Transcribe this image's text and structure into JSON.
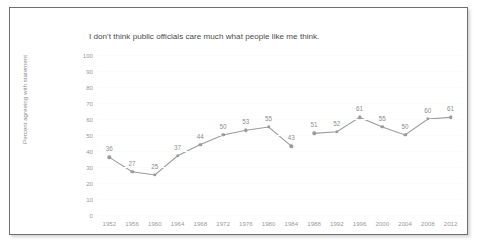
{
  "chart_data": {
    "type": "line",
    "title": "I don't think public officials care much what people like me think.",
    "xlabel": "",
    "ylabel": "Percent agreeing with statement",
    "categories": [
      "1952",
      "1956",
      "1960",
      "1964",
      "1968",
      "1972",
      "1976",
      "1980",
      "1984",
      "1988",
      "1992",
      "1996",
      "2000",
      "2004",
      "2008",
      "2012"
    ],
    "values": [
      36,
      27,
      25,
      37,
      44,
      50,
      53,
      55,
      43,
      51,
      52,
      61,
      55,
      50,
      60,
      61
    ],
    "segments": [
      {
        "categories": [
          "1952",
          "1956",
          "1960",
          "1964",
          "1968",
          "1972",
          "1976",
          "1980",
          "1984"
        ],
        "values": [
          36,
          27,
          25,
          37,
          44,
          50,
          53,
          55,
          43
        ]
      },
      {
        "categories": [
          "1988",
          "1992",
          "1996",
          "2000",
          "2004",
          "2008",
          "2012"
        ],
        "values": [
          51,
          52,
          61,
          55,
          50,
          60,
          61
        ]
      }
    ],
    "ylim": [
      0,
      100
    ],
    "y_ticks": [
      0,
      10,
      20,
      30,
      40,
      50,
      60,
      70,
      80,
      90,
      100
    ],
    "grid": true,
    "legend": false,
    "show_data_labels": true,
    "series_color": "#9b9b9b",
    "label_color": "#8e8e8e",
    "tick_color": "#9a9a9a",
    "title_color": "#4a4a4a",
    "border_color": "#6f6f6f",
    "background_color": "#ffffff"
  }
}
